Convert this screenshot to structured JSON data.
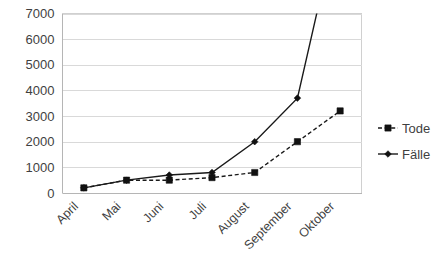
{
  "chart_data": {
    "type": "line",
    "title": "",
    "subtitle": "",
    "xlabel": "",
    "ylabel": "",
    "categories": [
      "April",
      "Mai",
      "Juni",
      "Juli",
      "August",
      "September",
      "Oktober"
    ],
    "series": [
      {
        "name": "Tode",
        "marker": "square",
        "linestyle": "dashed",
        "color": "#111111",
        "values": [
          200,
          500,
          500,
          600,
          800,
          2000,
          3200
        ]
      },
      {
        "name": "Fälle",
        "marker": "diamond",
        "linestyle": "solid",
        "color": "#111111",
        "values": [
          200,
          500,
          700,
          800,
          2000,
          3700,
          11000
        ]
      }
    ],
    "ylim": [
      0,
      7000
    ],
    "yticks": [
      0,
      1000,
      2000,
      3000,
      4000,
      5000,
      6000,
      7000
    ],
    "ytick_labels": [
      "0",
      "1000",
      "2000",
      "3000",
      "4000",
      "5000",
      "6000",
      "7000"
    ],
    "grid": true,
    "grid_axis": "y",
    "legend_position": "right",
    "xtick_rotation": -45
  },
  "legend": {
    "entries": [
      {
        "label": "Tode",
        "marker": "square",
        "linestyle": "dashed"
      },
      {
        "label": "Fälle",
        "marker": "diamond",
        "linestyle": "solid"
      }
    ]
  },
  "colors": {
    "series": "#111111",
    "grid": "#d9d9d9",
    "border": "#d0d0d0",
    "text": "#3f3f3f",
    "background": "#ffffff"
  }
}
